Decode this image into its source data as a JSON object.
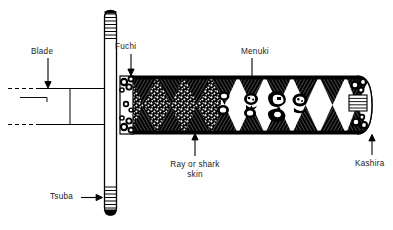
{
  "diagram": {
    "type": "labeled-line-illustration",
    "background_color": "#ffffff",
    "ink_color": "#000000",
    "labels": [
      {
        "id": "blade",
        "text": "Blade",
        "points_to": "sword blade / tang at left of guard",
        "arrow_direction": "down"
      },
      {
        "id": "fuchi",
        "text": "Fuchi",
        "points_to": "collar ferrule at base of the grip",
        "arrow_direction": "down"
      },
      {
        "id": "menuki",
        "text": "Menuki",
        "points_to": "ornaments under the hilt wrapping",
        "arrow_direction": "line"
      },
      {
        "id": "rayskin",
        "text": "Ray or shark\nskin",
        "line1": "Ray or shark",
        "line2": "skin",
        "points_to": "stippled same covering beneath the cord wrap",
        "arrow_direction": "up"
      },
      {
        "id": "tsuba",
        "text": "Tsuba",
        "points_to": "hand guard disc seen edge-on",
        "arrow_direction": "right"
      },
      {
        "id": "kashira",
        "text": "Kashira",
        "points_to": "pommel cap at the end of the grip",
        "arrow_direction": "up"
      }
    ],
    "parts": {
      "blade_label": "Blade",
      "fuchi_label": "Fuchi",
      "menuki_label": "Menuki",
      "rayskin_label_line1": "Ray or shark",
      "rayskin_label_line2": "skin",
      "tsuba_label": "Tsuba",
      "kashira_label": "Kashira"
    }
  }
}
